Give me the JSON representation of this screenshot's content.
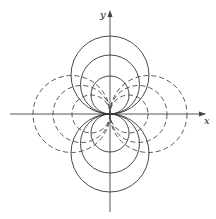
{
  "figure": {
    "type": "orthogonal circle families through origin",
    "axes": {
      "x_label": "x",
      "y_label": "y",
      "origin": [
        110,
        114
      ]
    },
    "solid_circles": {
      "description": "circles tangent to x-axis at origin, centers on y-axis",
      "radii": [
        39,
        29.5,
        19
      ],
      "style": "solid"
    },
    "dashed_circles": {
      "description": "circles tangent to y-axis at origin, centers on x-axis",
      "radii": [
        38.5,
        28.5,
        19
      ],
      "style": "dashed"
    },
    "colors": {
      "stroke": "#333333",
      "background": "#ffffff"
    }
  }
}
